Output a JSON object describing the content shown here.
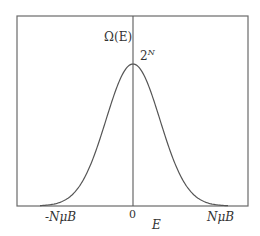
{
  "figure": {
    "y_axis_label": "Ω(E)",
    "peak_label_base": "2",
    "peak_label_exp": "N",
    "x_axis_label": "E",
    "x_ticks": [
      "-NμB",
      "0",
      "NμB"
    ]
  },
  "colors": {
    "line": "#555555",
    "text": "#333333",
    "background": "#ffffff"
  },
  "chart_data": {
    "type": "line",
    "title": "",
    "xlabel": "E",
    "ylabel": "Ω(E)",
    "x_tick_labels": [
      "-NμB",
      "0",
      "NμB"
    ],
    "annotations": [
      "2^N (peak value at E = 0)"
    ],
    "x": [
      -1.0,
      -0.8,
      -0.6,
      -0.4,
      -0.2,
      0.0,
      0.2,
      0.4,
      0.6,
      0.8,
      1.0
    ],
    "series": [
      {
        "name": "Ω(E) (relative to 2^N)",
        "values": [
          0.01,
          0.05,
          0.19,
          0.48,
          0.83,
          1.0,
          0.83,
          0.48,
          0.19,
          0.05,
          0.01
        ]
      }
    ],
    "xlim": [
      -1.35,
      1.35
    ],
    "ylim": [
      0,
      1.0
    ],
    "grid": false,
    "legend": "none"
  }
}
